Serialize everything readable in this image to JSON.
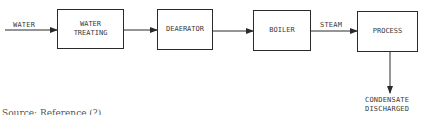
{
  "diagram": {
    "type": "process-flow",
    "input_label": "WATER",
    "nodes": [
      {
        "id": "water-treating",
        "label": "WATER\nTREATING"
      },
      {
        "id": "deaerator",
        "label": "DEAERATOR"
      },
      {
        "id": "boiler",
        "label": "BOILER"
      },
      {
        "id": "process",
        "label": "PROCESS"
      }
    ],
    "edges": [
      {
        "from": "input",
        "to": "water-treating",
        "label": "WATER"
      },
      {
        "from": "water-treating",
        "to": "deaerator",
        "label": ""
      },
      {
        "from": "deaerator",
        "to": "boiler",
        "label": ""
      },
      {
        "from": "boiler",
        "to": "process",
        "label": "STEAM"
      },
      {
        "from": "process",
        "to": "output",
        "label": "CONDENSATE DISCHARGED"
      }
    ],
    "steam_label": "STEAM",
    "output_label_line1": "CONDENSATE",
    "output_label_line2": "DISCHARGED",
    "caption": "Source: Reference (?)"
  }
}
